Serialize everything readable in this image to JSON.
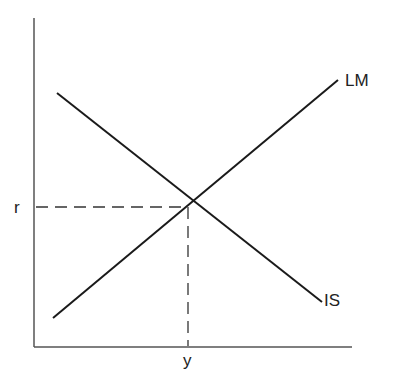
{
  "diagram": {
    "type": "IS-LM model",
    "curves": [
      {
        "label": "LM",
        "slope": "upward",
        "from": [
          53,
          318
        ],
        "to": [
          338,
          80
        ]
      },
      {
        "label": "IS",
        "slope": "downward",
        "from": [
          57,
          93
        ],
        "to": [
          322,
          302
        ]
      }
    ],
    "equilibrium": {
      "x_label": "y",
      "y_label": "r",
      "point": [
        188,
        207
      ]
    },
    "axes": {
      "origin": [
        34,
        347
      ],
      "y_top": [
        34,
        18
      ],
      "x_end": [
        352,
        347
      ]
    },
    "colors": {
      "line": "#1a1a1a",
      "axis": "#4a4a4a",
      "dash": "#333333"
    }
  }
}
